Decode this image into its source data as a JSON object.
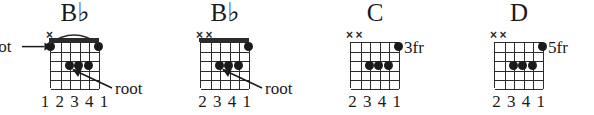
{
  "page": {
    "background": "#ffffff",
    "ink": "#1a1a1a",
    "width": 594,
    "height": 115
  },
  "diagrams": [
    {
      "id": "chord-bb-barre-e-shape",
      "name_root": "B",
      "name_accidental": "♭",
      "left": 0,
      "has_nut": true,
      "has_barre_arc": true,
      "position_label": "",
      "muted_strings": [
        1
      ],
      "dots": [
        {
          "string": 1,
          "fret": 1
        },
        {
          "string": 6,
          "fret": 1
        },
        {
          "string": 3,
          "fret": 3
        },
        {
          "string": 4,
          "fret": 3
        },
        {
          "string": 5,
          "fret": 3
        }
      ],
      "fingering": "1 2 3 4 1",
      "annotations": [
        {
          "label": "root",
          "kind": "arrow-right",
          "target_string": 1,
          "target_fret": 1
        },
        {
          "label": "root",
          "kind": "arrow-diagonal",
          "target_string": 3,
          "target_fret": 3
        }
      ]
    },
    {
      "id": "chord-bb-barre-a-shape",
      "name_root": "B",
      "name_accidental": "♭",
      "left": 150,
      "has_nut": true,
      "has_barre_arc": false,
      "position_label": "",
      "muted_strings": [
        1,
        2
      ],
      "dots": [
        {
          "string": 6,
          "fret": 1
        },
        {
          "string": 3,
          "fret": 3
        },
        {
          "string": 4,
          "fret": 3
        },
        {
          "string": 5,
          "fret": 3
        }
      ],
      "fingering": "2 3 4 1",
      "annotations": [
        {
          "label": "root",
          "kind": "arrow-diagonal",
          "target_string": 3,
          "target_fret": 3
        }
      ]
    },
    {
      "id": "chord-c-3fr",
      "name_root": "C",
      "name_accidental": "",
      "left": 300,
      "has_nut": false,
      "has_barre_arc": false,
      "position_label": "3fr",
      "muted_strings": [
        1,
        2
      ],
      "dots": [
        {
          "string": 6,
          "fret": 1
        },
        {
          "string": 3,
          "fret": 3
        },
        {
          "string": 4,
          "fret": 3
        },
        {
          "string": 5,
          "fret": 3
        }
      ],
      "fingering": "2 3 4 1",
      "annotations": []
    },
    {
      "id": "chord-d-5fr",
      "name_root": "D",
      "name_accidental": "",
      "left": 444,
      "has_nut": false,
      "has_barre_arc": false,
      "position_label": "5fr",
      "muted_strings": [
        1,
        2
      ],
      "dots": [
        {
          "string": 6,
          "fret": 1
        },
        {
          "string": 3,
          "fret": 3
        },
        {
          "string": 4,
          "fret": 3
        },
        {
          "string": 5,
          "fret": 3
        }
      ],
      "fingering": "2 3 4 1",
      "annotations": []
    }
  ],
  "geometry": {
    "strings": 6,
    "frets": 5,
    "string_spacing": 9.6,
    "fret_spacing": 9.2
  }
}
